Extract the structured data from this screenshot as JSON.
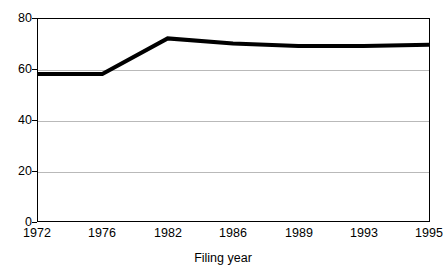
{
  "chart_data": {
    "type": "line",
    "title": "",
    "xlabel": "Filing year",
    "ylabel": "",
    "categories": [
      "1972",
      "1976",
      "1982",
      "1986",
      "1989",
      "1993",
      "1995"
    ],
    "values": [
      58,
      58,
      72,
      70,
      69,
      69,
      69.5
    ],
    "series": [
      {
        "name": "",
        "values": [
          58,
          58,
          72,
          70,
          69,
          69,
          69.5
        ]
      }
    ],
    "ylim": [
      0,
      80
    ],
    "yticks": [
      0,
      20,
      40,
      60,
      80
    ],
    "ytick_labels": [
      "0",
      "20",
      "40",
      "60",
      "80"
    ],
    "xtick_labels": [
      "1972",
      "1976",
      "1982",
      "1986",
      "1989",
      "1993",
      "1995"
    ],
    "grid": true,
    "grid_axis": "y",
    "legend": false,
    "legend_position": "none",
    "line_color": "#000000",
    "line_width": 3,
    "grid_color": "#b9b9b9",
    "axis_color": "#000000",
    "background": "#ffffff"
  },
  "axis": {
    "x_title": "Filing year",
    "y_ticks": [
      {
        "label": "80",
        "value": 80
      },
      {
        "label": "60",
        "value": 60
      },
      {
        "label": "40",
        "value": 40
      },
      {
        "label": "20",
        "value": 20
      },
      {
        "label": "0",
        "value": 0
      }
    ],
    "x_ticks": [
      {
        "label": "1972"
      },
      {
        "label": "1976"
      },
      {
        "label": "1982"
      },
      {
        "label": "1986"
      },
      {
        "label": "1989"
      },
      {
        "label": "1993"
      },
      {
        "label": "1995"
      }
    ]
  }
}
